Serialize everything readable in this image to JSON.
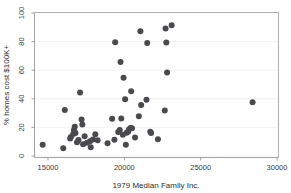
{
  "chart_data": {
    "type": "scatter",
    "title": "",
    "xlabel": "1979 Median Family Inc.",
    "ylabel": "% homes cost $100K+",
    "xlim": [
      14200,
      30600
    ],
    "ylim": [
      -3,
      101
    ],
    "xticks": [
      15000,
      20000,
      25000,
      30000
    ],
    "xtick_labels": [
      "15000",
      "20000",
      "25000",
      "30000"
    ],
    "yticks": [
      0,
      20,
      40,
      60,
      80,
      100
    ],
    "ytick_labels": [
      "0",
      "20",
      "40",
      "60",
      "80",
      "100"
    ],
    "grid": "horizontal-light",
    "legend": "none",
    "marker_color": "#4a4a4e",
    "marker_size": 3.0,
    "points": [
      {
        "x": 14650,
        "y": 7.8
      },
      {
        "x": 16000,
        "y": 5.4
      },
      {
        "x": 16100,
        "y": 32.1
      },
      {
        "x": 16450,
        "y": 12.2
      },
      {
        "x": 16500,
        "y": 13.2
      },
      {
        "x": 16650,
        "y": 15.4
      },
      {
        "x": 16700,
        "y": 18.1
      },
      {
        "x": 16750,
        "y": 20.4
      },
      {
        "x": 16800,
        "y": 16.0
      },
      {
        "x": 16900,
        "y": 9.6
      },
      {
        "x": 17000,
        "y": 11.2
      },
      {
        "x": 17100,
        "y": 44.4
      },
      {
        "x": 17200,
        "y": 25.6
      },
      {
        "x": 17250,
        "y": 22.0
      },
      {
        "x": 17300,
        "y": 8.2
      },
      {
        "x": 17400,
        "y": 13.8
      },
      {
        "x": 17550,
        "y": 9.2
      },
      {
        "x": 17750,
        "y": 10.4
      },
      {
        "x": 17800,
        "y": 6.2
      },
      {
        "x": 17950,
        "y": 11.6
      },
      {
        "x": 18100,
        "y": 15.2
      },
      {
        "x": 18250,
        "y": 11.0
      },
      {
        "x": 18900,
        "y": 9.0
      },
      {
        "x": 19200,
        "y": 26.0
      },
      {
        "x": 19350,
        "y": 11.4
      },
      {
        "x": 19400,
        "y": 79.6
      },
      {
        "x": 19600,
        "y": 16.8
      },
      {
        "x": 19700,
        "y": 18.2
      },
      {
        "x": 19750,
        "y": 65.8
      },
      {
        "x": 19800,
        "y": 26.2
      },
      {
        "x": 19900,
        "y": 14.8
      },
      {
        "x": 19950,
        "y": 54.8
      },
      {
        "x": 20050,
        "y": 39.6
      },
      {
        "x": 20100,
        "y": 7.8
      },
      {
        "x": 20150,
        "y": 16.2
      },
      {
        "x": 20250,
        "y": 17.0
      },
      {
        "x": 20300,
        "y": 18.6
      },
      {
        "x": 20400,
        "y": 19.6
      },
      {
        "x": 20450,
        "y": 45.2
      },
      {
        "x": 20500,
        "y": 19.4
      },
      {
        "x": 20700,
        "y": 13.0
      },
      {
        "x": 20950,
        "y": 27.8
      },
      {
        "x": 21050,
        "y": 87.2
      },
      {
        "x": 21100,
        "y": 35.6
      },
      {
        "x": 21450,
        "y": 39.4
      },
      {
        "x": 21500,
        "y": 79.0
      },
      {
        "x": 21700,
        "y": 17.0
      },
      {
        "x": 21750,
        "y": 16.0
      },
      {
        "x": 22200,
        "y": 11.8
      },
      {
        "x": 22650,
        "y": 31.8
      },
      {
        "x": 22700,
        "y": 89.2
      },
      {
        "x": 22750,
        "y": 79.4
      },
      {
        "x": 22800,
        "y": 58.4
      },
      {
        "x": 23100,
        "y": 91.4
      },
      {
        "x": 28400,
        "y": 37.6
      }
    ]
  },
  "axes": {
    "x_title": "1979 Median Family Inc.",
    "y_title": "% homes cost $100K+"
  }
}
